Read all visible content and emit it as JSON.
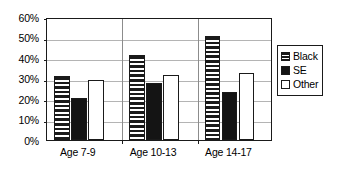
{
  "chart_data": {
    "type": "bar",
    "title": "",
    "xlabel": "",
    "ylabel": "",
    "categories": [
      "Age 7-9",
      "Age 10-13",
      "Age 14-17"
    ],
    "series": [
      {
        "name": "Black",
        "pattern": "horizontal-stripes",
        "values": [
          31,
          41.5,
          50.5
        ]
      },
      {
        "name": "SE",
        "pattern": "solid-black",
        "values": [
          20.5,
          28,
          23.5
        ]
      },
      {
        "name": "Other",
        "pattern": "hollow-white",
        "values": [
          29.5,
          31.5,
          32.5
        ]
      }
    ],
    "ylim": [
      0,
      60
    ],
    "ytick_values": [
      0,
      10,
      20,
      30,
      40,
      50,
      60
    ],
    "ytick_labels": [
      "0%",
      "10%",
      "20%",
      "30%",
      "40%",
      "50%",
      "60%"
    ],
    "grid": "horizontal",
    "legend_position": "right",
    "value_unit": "percent",
    "colors": {
      "axis": "#1a1a1a",
      "gridline": "#b4b4b4",
      "bar_fill_solid": "#141414",
      "bar_fill_hollow": "#ffffff",
      "background": "#ffffff"
    }
  },
  "legend": {
    "entries": [
      {
        "label": "Black",
        "swatch": "striped-swatch-icon"
      },
      {
        "label": "SE",
        "swatch": "solid-swatch-icon"
      },
      {
        "label": "Other",
        "swatch": "hollow-swatch-icon"
      }
    ]
  }
}
